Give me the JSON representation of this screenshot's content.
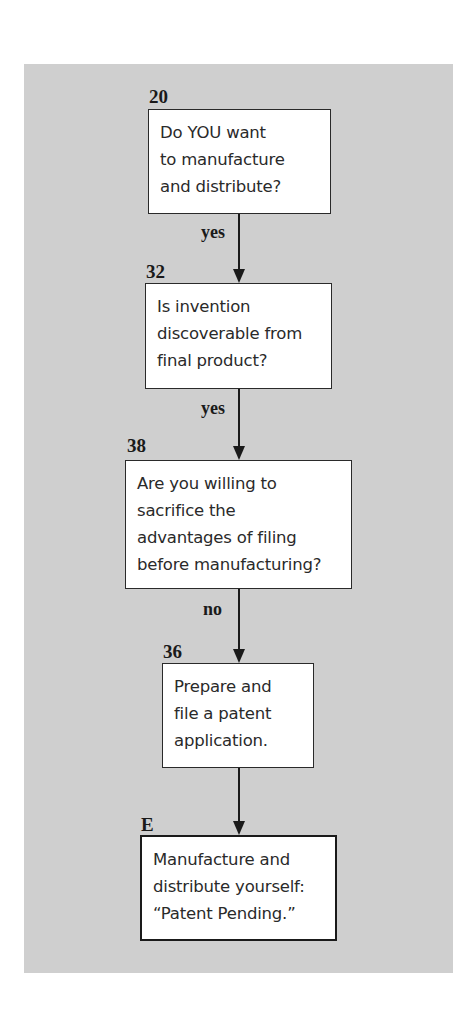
{
  "diagram": {
    "type": "flowchart",
    "nodes": [
      {
        "id": "20",
        "label": "20",
        "lines": [
          "Do YOU want",
          "to manufacture",
          "and distribute?"
        ]
      },
      {
        "id": "32",
        "label": "32",
        "lines": [
          "Is invention",
          "discoverable from",
          "final product?"
        ]
      },
      {
        "id": "38",
        "label": "38",
        "lines": [
          "Are you willing to",
          "sacrifice the",
          "advantages of filing",
          "before manufacturing?"
        ]
      },
      {
        "id": "36",
        "label": "36",
        "lines": [
          "Prepare and",
          "file a patent",
          "application."
        ]
      },
      {
        "id": "E",
        "label": "E",
        "lines": [
          "Manufacture and",
          "distribute yourself:",
          "“Patent Pending.”"
        ],
        "terminal": true
      }
    ],
    "edges": [
      {
        "from": "20",
        "to": "32",
        "label": "yes"
      },
      {
        "from": "32",
        "to": "38",
        "label": "yes"
      },
      {
        "from": "38",
        "to": "36",
        "label": "no"
      },
      {
        "from": "36",
        "to": "E",
        "label": ""
      }
    ],
    "colors": {
      "panel_background": "#cfcfcf",
      "box_fill": "#ffffff",
      "stroke": "#1a1a1a"
    }
  }
}
